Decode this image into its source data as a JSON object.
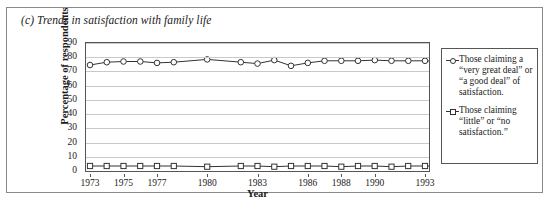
{
  "chart_data": {
    "type": "line",
    "title": "(c) Trends in satisfaction with family life",
    "xlabel": "Year",
    "ylabel": "Percentage of respondents",
    "xlim": [
      1973,
      1993
    ],
    "ylim": [
      0,
      90
    ],
    "ytick_step": 10,
    "grid": true,
    "legend_position": "right-outside",
    "yticks": [
      90,
      80,
      70,
      60,
      50,
      40,
      30,
      20,
      10,
      0
    ],
    "xtick_labels": [
      "1973",
      "1975",
      "1977",
      "1980",
      "1983",
      "1986",
      "1988",
      "1990",
      "1993"
    ],
    "x": [
      1973,
      1974,
      1975,
      1976,
      1977,
      1978,
      1980,
      1982,
      1983,
      1984,
      1985,
      1986,
      1987,
      1988,
      1989,
      1990,
      1991,
      1992,
      1993,
      1994
    ],
    "series": [
      {
        "name": "Those claiming a “very great deal” or “a good deal” of satisfaction.",
        "marker": "circle",
        "values": [
          74.5,
          76.5,
          77.0,
          77.0,
          76.0,
          76.5,
          78.5,
          76.5,
          75.5,
          78.0,
          74.0,
          76.0,
          77.5,
          77.5,
          77.5,
          78.0,
          77.5,
          77.5,
          77.5,
          77.0
        ]
      },
      {
        "name": "Those claiming “little” or “no satisfaction.”",
        "marker": "square",
        "values": [
          3.5,
          3.5,
          3.5,
          3.5,
          3.5,
          3.5,
          3.0,
          3.5,
          3.5,
          3.0,
          3.5,
          3.5,
          3.5,
          3.0,
          3.5,
          3.5,
          3.0,
          3.5,
          3.5,
          3.5
        ]
      }
    ]
  },
  "legend": {
    "entries": [
      {
        "label": "Those claiming a “very great deal” or “a good deal” of satisfaction.",
        "marker": "circle"
      },
      {
        "label": "Those claiming “little” or “no satisfaction.”",
        "marker": "square"
      }
    ]
  },
  "colors": {
    "line": "#333333",
    "grid": "#c9c9c9",
    "frame": "#555555",
    "border": "#8a8a8a"
  }
}
